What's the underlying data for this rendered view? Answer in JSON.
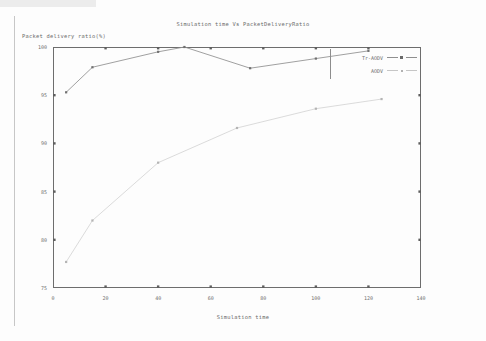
{
  "chart_data": {
    "type": "line",
    "title": "Simulation time Vs PacketDeliveryRatio",
    "xlabel": "Simulation time",
    "ylabel": "Packet delivery ratio(%)",
    "xlim": [
      0,
      140
    ],
    "ylim": [
      75,
      100
    ],
    "xticks": [
      0,
      20,
      40,
      60,
      80,
      100,
      120,
      140
    ],
    "yticks": [
      75,
      80,
      85,
      90,
      95,
      100
    ],
    "xtick_labels": [
      "0",
      "20",
      "40",
      "60",
      "80",
      "100",
      "120",
      "140"
    ],
    "ytick_labels": [
      "75",
      "80",
      "85",
      "90",
      "95",
      "100"
    ],
    "grid": false,
    "legend_position": "top-right-inside",
    "series": [
      {
        "name": "Tr-AODV",
        "color": "#8f8f8f",
        "points": [
          {
            "x": 5,
            "y": 95.3
          },
          {
            "x": 15,
            "y": 97.9
          },
          {
            "x": 40,
            "y": 99.5
          },
          {
            "x": 50,
            "y": 100.0
          },
          {
            "x": 75,
            "y": 97.8
          },
          {
            "x": 100,
            "y": 98.8
          },
          {
            "x": 120,
            "y": 99.6
          }
        ]
      },
      {
        "name": "AODV",
        "color": "#c9c9c9",
        "points": [
          {
            "x": 5,
            "y": 77.7
          },
          {
            "x": 15,
            "y": 82.0
          },
          {
            "x": 40,
            "y": 88.0
          },
          {
            "x": 70,
            "y": 91.6
          },
          {
            "x": 100,
            "y": 93.6
          },
          {
            "x": 125,
            "y": 94.6
          }
        ]
      }
    ]
  },
  "legend": {
    "entries": [
      {
        "label": "Tr-AODV"
      },
      {
        "label": "AODV"
      }
    ]
  }
}
